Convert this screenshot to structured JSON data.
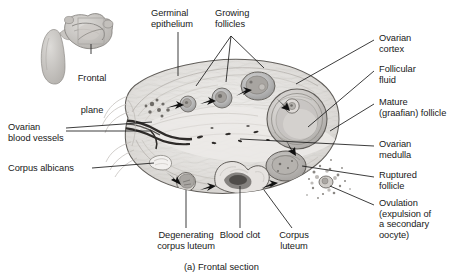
{
  "figure": {
    "caption": "(a) Frontal section",
    "background_color": "#ffffff",
    "text_color": "#191919",
    "leader_color": "#1a1a1a"
  },
  "inset": {
    "name": "uterus-frontal-plane-inset",
    "label_line1": "Frontal",
    "label_line2": "plane"
  },
  "labels": {
    "germinal_epithelium": "Germinal\nepithelium",
    "growing_follicles": "Growing\nfollicles",
    "ovarian_cortex": "Ovarian\ncortex",
    "follicular_fluid": "Follicular\nfluid",
    "mature_follicle": "Mature\n(graafian) follicle",
    "ovarian_medulla": "Ovarian\nmedulla",
    "ruptured_follicle": "Ruptured\nfollicle",
    "ovulation": "Ovulation\n(expulsion of\na secondary\noocyte)",
    "ovarian_blood_vessels": "Ovarian\nblood vessels",
    "corpus_albicans": "Corpus albicans",
    "degenerating_corpus_luteum": "Degenerating\ncorpus luteum",
    "blood_clot": "Blood clot",
    "corpus_luteum": "Corpus\nluteum"
  },
  "diagram": {
    "type": "anatomical-illustration",
    "view": "frontal section",
    "structures": [
      "germinal epithelium",
      "growing follicles",
      "ovarian cortex",
      "follicular fluid",
      "mature (graafian) follicle",
      "ovarian medulla",
      "ruptured follicle",
      "ovulation",
      "ovarian blood vessels",
      "corpus albicans",
      "degenerating corpus luteum",
      "blood clot",
      "corpus luteum"
    ]
  }
}
